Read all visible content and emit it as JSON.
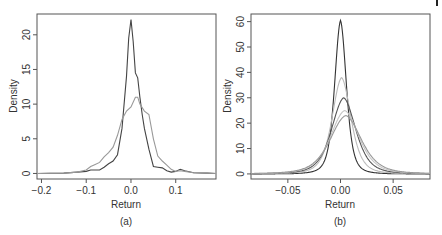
{
  "chart_data": [
    {
      "type": "line",
      "panel": "a",
      "caption": "(a)",
      "title": "",
      "xlabel": "Return",
      "ylabel": "Density",
      "xlim": [
        -0.21,
        0.19
      ],
      "ylim": [
        -0.8,
        23
      ],
      "xticks": [
        -0.2,
        -0.1,
        0.0,
        0.1
      ],
      "xtick_labels": [
        "−0.2",
        "−0.1",
        "0.0",
        "0.1"
      ],
      "yticks": [
        0,
        5,
        10,
        15,
        20
      ],
      "ytick_labels": [
        "0",
        "5",
        "10",
        "15",
        "20"
      ],
      "grid": false,
      "legend": null,
      "series": [
        {
          "name": "empirical density (dark)",
          "color": "#444444",
          "x": [
            -0.21,
            -0.15,
            -0.12,
            -0.1,
            -0.09,
            -0.08,
            -0.07,
            -0.06,
            -0.05,
            -0.04,
            -0.03,
            -0.02,
            -0.01,
            -0.005,
            0.0,
            0.005,
            0.01,
            0.015,
            0.02,
            0.025,
            0.03,
            0.04,
            0.05,
            0.06,
            0.07,
            0.08,
            0.09,
            0.1,
            0.11,
            0.12,
            0.14,
            0.17,
            0.19
          ],
          "y": [
            0,
            0.05,
            0.2,
            0.3,
            0.5,
            0.5,
            0.5,
            0.9,
            1.4,
            1.8,
            2.7,
            6.5,
            14.0,
            19.5,
            22.2,
            19.0,
            14.5,
            13.8,
            11.0,
            8.5,
            6.5,
            3.5,
            1.0,
            0.9,
            0.8,
            0.4,
            0.2,
            0.3,
            0.6,
            0.4,
            0.1,
            0.05,
            0.0
          ]
        },
        {
          "name": "comparison density (light)",
          "color": "#999999",
          "x": [
            -0.21,
            -0.15,
            -0.12,
            -0.1,
            -0.09,
            -0.08,
            -0.07,
            -0.06,
            -0.05,
            -0.04,
            -0.03,
            -0.02,
            -0.01,
            0.0,
            0.01,
            0.015,
            0.02,
            0.03,
            0.04,
            0.05,
            0.06,
            0.07,
            0.08,
            0.09,
            0.1,
            0.11,
            0.12,
            0.14,
            0.17,
            0.19
          ],
          "y": [
            0,
            0.05,
            0.2,
            0.5,
            1.0,
            1.3,
            1.6,
            2.4,
            3.0,
            3.8,
            5.5,
            7.8,
            9.0,
            9.6,
            11.0,
            11.0,
            10.0,
            9.0,
            8.5,
            5.0,
            2.5,
            1.8,
            1.2,
            0.6,
            0.3,
            0.4,
            0.3,
            0.1,
            0.05,
            0.0
          ]
        }
      ]
    },
    {
      "type": "line",
      "panel": "b",
      "caption": "(b)",
      "title": "",
      "xlabel": "Return",
      "ylabel": "Density",
      "xlim": [
        -0.085,
        0.085
      ],
      "ylim": [
        -2,
        63
      ],
      "xticks": [
        -0.05,
        0.0,
        0.05
      ],
      "xtick_labels": [
        "−0.05",
        "0.00",
        "0.05"
      ],
      "yticks": [
        0,
        10,
        20,
        30,
        40,
        50,
        60
      ],
      "ytick_labels": [
        "0",
        "10",
        "20",
        "30",
        "40",
        "50",
        "60"
      ],
      "grid": false,
      "legend": null,
      "series": [
        {
          "name": "density 1 (darkest, peak ~60)",
          "color": "#333333",
          "peak_x": 0.0,
          "peak_y": 60.5,
          "scale": 0.0065
        },
        {
          "name": "density 2 (light, peak ~38)",
          "color": "#bbbbbb",
          "peak_x": 0.001,
          "peak_y": 38,
          "scale": 0.0105
        },
        {
          "name": "density 3 (dark, peak ~30)",
          "color": "#555555",
          "peak_x": 0.003,
          "peak_y": 30,
          "scale": 0.0135
        },
        {
          "name": "density 4 (light, peak ~25)",
          "color": "#c4c4c4",
          "peak_x": 0.004,
          "peak_y": 25,
          "scale": 0.016
        },
        {
          "name": "density 5 (medium, peak ~23)",
          "color": "#999999",
          "peak_x": 0.005,
          "peak_y": 23,
          "scale": 0.0175
        }
      ]
    }
  ]
}
